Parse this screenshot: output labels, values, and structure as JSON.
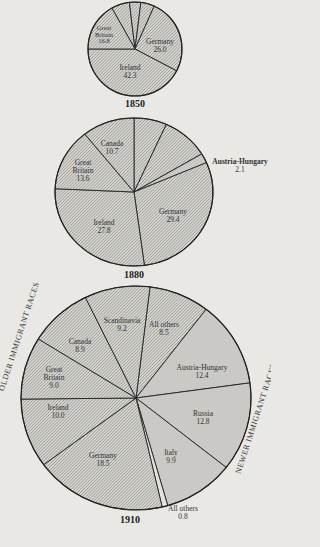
{
  "chart_data": [
    {
      "type": "pie",
      "title": "1850",
      "center": [
        135,
        49
      ],
      "rx": 47,
      "ry": 47,
      "start_deg": 330.5,
      "slices": [
        {
          "label": "Canada",
          "value": 6.3,
          "pattern": "hatch",
          "label_pos": null
        },
        {
          "label": "Scandinavia",
          "value": 3.9,
          "pattern": "hatch",
          "label_pos": null
        },
        {
          "label": "All others",
          "value": 4.7,
          "pattern": "hatch",
          "label_pos": null
        },
        {
          "label": "Germany",
          "value": 26.0,
          "pattern": "hatch",
          "label_pos": [
            160,
            46
          ]
        },
        {
          "label": "Ireland",
          "value": 42.3,
          "pattern": "hatch",
          "label_pos": [
            130,
            72
          ]
        },
        {
          "label": "Great Britain",
          "value": 16.8,
          "pattern": "hatch",
          "label_pos": [
            104,
            35
          ]
        }
      ]
    },
    {
      "type": "pie",
      "title": "1880",
      "center": [
        134,
        192
      ],
      "rx": 79,
      "ry": 74,
      "start_deg": 0,
      "slices": [
        {
          "label": "Scandinavia",
          "value": 6.7,
          "pattern": "hatch",
          "label_pos": null
        },
        {
          "label": "All others",
          "value": 9.7,
          "pattern": "hatch",
          "label_pos": null
        },
        {
          "label": "Austria-Hungary",
          "value": 2.1,
          "pattern": "dots",
          "label_pos": [
            236,
            165
          ]
        },
        {
          "label": "Germany",
          "value": 29.4,
          "pattern": "hatch",
          "label_pos": [
            173,
            216
          ]
        },
        {
          "label": "Ireland",
          "value": 27.8,
          "pattern": "hatch",
          "label_pos": [
            104,
            227
          ]
        },
        {
          "label": "Great Britain",
          "value": 13.6,
          "pattern": "hatch",
          "label_pos": [
            83,
            171
          ]
        },
        {
          "label": "Canada",
          "value": 10.7,
          "pattern": "hatch",
          "label_pos": [
            112,
            148
          ]
        }
      ]
    },
    {
      "type": "pie",
      "title": "1910",
      "center": [
        136,
        398
      ],
      "rx": 115,
      "ry": 112,
      "start_deg": 7,
      "slices": [
        {
          "label": "All others",
          "value": 8.5,
          "pattern": "hatch",
          "label_pos": [
            164,
            328
          ]
        },
        {
          "label": "Austria-Hungary",
          "value": 12.4,
          "pattern": "dots",
          "label_pos": [
            200,
            371
          ]
        },
        {
          "label": "Russia",
          "value": 12.8,
          "pattern": "dots",
          "label_pos": [
            200,
            418
          ]
        },
        {
          "label": "Italy",
          "value": 9.9,
          "pattern": "dots",
          "label_pos": [
            171,
            458
          ]
        },
        {
          "label": "All others",
          "value": 0.8,
          "pattern": "blank",
          "label_pos": [
            178,
            513
          ]
        },
        {
          "label": "Germany",
          "value": 18.5,
          "pattern": "hatch",
          "label_pos": [
            103,
            460
          ]
        },
        {
          "label": "Ireland",
          "value": 10.0,
          "pattern": "hatch",
          "label_pos": [
            59,
            412
          ]
        },
        {
          "label": "Great Britain",
          "value": 9.0,
          "pattern": "hatch",
          "label_pos": [
            54,
            378
          ]
        },
        {
          "label": "Canada",
          "value": 8.9,
          "pattern": "hatch",
          "label_pos": [
            80,
            346
          ]
        },
        {
          "label": "Scandinavia",
          "value": 9.2,
          "pattern": "hatch",
          "label_pos": [
            122,
            324
          ]
        }
      ]
    }
  ],
  "years": {
    "y1850": "1850",
    "y1880": "1880",
    "y1910": "1910"
  },
  "labels": {
    "c1850": {
      "germany": "Germany",
      "germany_v": "26.0",
      "ireland": "Ireland",
      "ireland_v": "42.3",
      "gb1": "Great",
      "gb2": "Britain",
      "gb_v": "16.8"
    },
    "c1880": {
      "canada": "Canada",
      "canada_v": "10.7",
      "gb1": "Great",
      "gb2": "Britain",
      "gb_v": "13.6",
      "germany": "Germany",
      "germany_v": "29.4",
      "ireland": "Ireland",
      "ireland_v": "27.8",
      "ah": "Austria-Hungary",
      "ah_v": "2.1"
    },
    "c1910": {
      "scand": "Scandinavia",
      "scand_v": "9.2",
      "other": "All others",
      "other_v": "8.5",
      "canada": "Canada",
      "canada_v": "8.9",
      "gb1": "Great",
      "gb2": "Britain",
      "gb_v": "9.0",
      "ireland": "Ireland",
      "ireland_v": "10.0",
      "germany": "Germany",
      "germany_v": "18.5",
      "ah": "Austria-Hungary",
      "ah_v": "12.4",
      "russia": "Russia",
      "russia_v": "12.8",
      "italy": "Italy",
      "italy_v": "9.9",
      "other2": "All others",
      "other2_v": "0.8"
    },
    "older": "OLDER IMMIGRANT RACES",
    "newer": "NEWER IMMIGRANT RACES"
  }
}
